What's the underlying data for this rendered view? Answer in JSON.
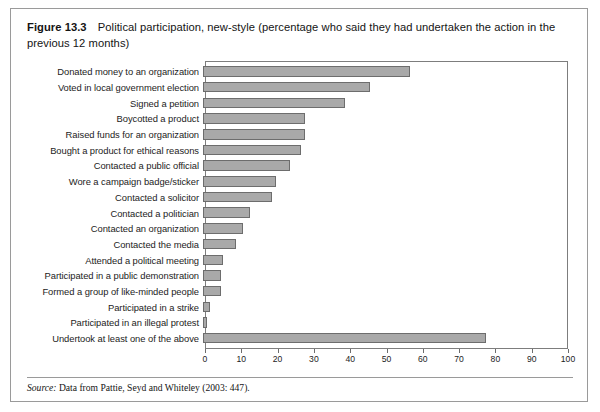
{
  "figure": {
    "label": "Figure",
    "number": "13.3",
    "caption": "Political participation, new-style (percentage who said they had undertaken the action in the previous 12 months)"
  },
  "source": {
    "prefix": "Source:",
    "text": "Data from Pattie, Seyd and Whiteley (2003: 447)."
  },
  "colors": {
    "bar_fill": "#a9a9a9",
    "bar_border": "#6d6d6d",
    "frame": "#7d7d7d",
    "box_border": "#9a9a9a",
    "text": "#1c1c1c"
  },
  "chart_data": {
    "type": "bar",
    "orientation": "horizontal",
    "title": "Political participation, new-style (percentage who said they had undertaken the action in the previous 12 months)",
    "xlabel": "",
    "ylabel": "",
    "xlim": [
      0,
      100
    ],
    "xticks": [
      0,
      10,
      20,
      30,
      40,
      50,
      60,
      70,
      80,
      90,
      100
    ],
    "grid": false,
    "legend": false,
    "categories": [
      "Donated money to an organization",
      "Voted in local government election",
      "Signed a petition",
      "Boycotted a product",
      "Raised funds for an organization",
      "Bought a product for ethical reasons",
      "Contacted a public official",
      "Wore a campaign badge/sticker",
      "Contacted a solicitor",
      "Contacted a politician",
      "Contacted an organization",
      "Contacted the media",
      "Attended a political meeting",
      "Participated in a public demonstration",
      "Formed a group of like-minded people",
      "Participated in a strike",
      "Participated in an illegal protest",
      "Undertook at least one of the above"
    ],
    "values": [
      57,
      46,
      39,
      28,
      28,
      27,
      24,
      20,
      19,
      13,
      11,
      9,
      5.5,
      5,
      5,
      2,
      1,
      78
    ]
  }
}
